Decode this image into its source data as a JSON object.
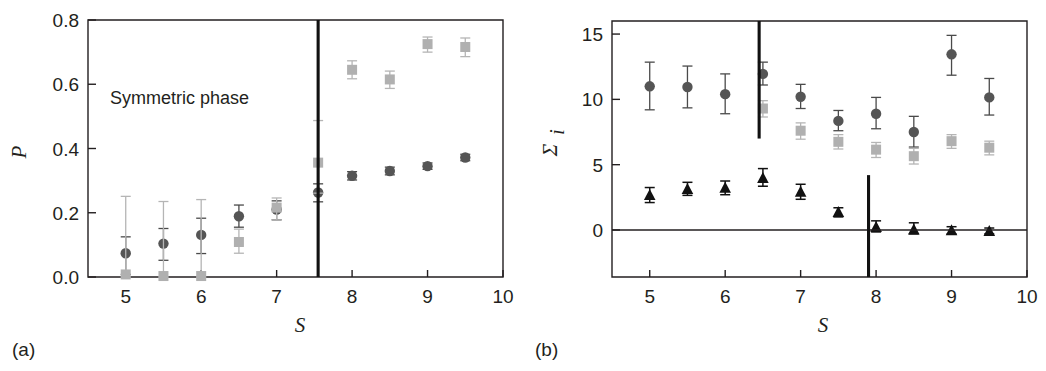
{
  "figure": {
    "background": "#ffffff",
    "marker_colors": {
      "circle": "#555555",
      "square": "#b0b0b0",
      "triangle": "#111111"
    }
  },
  "panels": [
    {
      "key": "a",
      "label": "(a)",
      "xlabel": "S",
      "ylabel": "P",
      "annotation": "Symmetric phase",
      "xticks": [
        "5",
        "6",
        "7",
        "8",
        "9",
        "10"
      ],
      "yticks": [
        "0.0",
        "0.2",
        "0.4",
        "0.6",
        "0.8"
      ]
    },
    {
      "key": "b",
      "label": "(b)",
      "xlabel": "S",
      "ylabel": "Σ",
      "ylabel_sub": "i",
      "xticks": [
        "5",
        "6",
        "7",
        "8",
        "9",
        "10"
      ],
      "yticks": [
        "0",
        "5",
        "10",
        "15"
      ]
    }
  ],
  "chart_data": [
    {
      "type": "scatter",
      "panel": "a",
      "title": "",
      "xlabel": "S",
      "ylabel": "P",
      "xlim": [
        4.5,
        10.0
      ],
      "ylim": [
        0.0,
        0.8
      ],
      "xticks": [
        5,
        6,
        7,
        8,
        9,
        10
      ],
      "yticks": [
        0.0,
        0.2,
        0.4,
        0.6,
        0.8
      ],
      "grid": false,
      "legend": "none",
      "annotations": [
        {
          "text": "Symmetric phase",
          "x": 6.1,
          "y": 0.53
        }
      ],
      "vlines": [
        {
          "x": 7.55,
          "y_from": 0.0,
          "y_to": 0.8,
          "color": "#111111"
        }
      ],
      "series": [
        {
          "name": "dark-circles",
          "marker": "circle",
          "color": "#555555",
          "x": [
            5.0,
            5.5,
            6.0,
            6.5,
            7.0,
            7.55,
            8.0,
            8.5,
            9.0,
            9.5
          ],
          "y": [
            0.074,
            0.104,
            0.131,
            0.189,
            0.21,
            0.263,
            0.315,
            0.33,
            0.345,
            0.372
          ],
          "yerr_low": [
            0.066,
            0.052,
            0.058,
            0.034,
            0.032,
            0.029,
            0.013,
            0.012,
            0.01,
            0.01
          ],
          "yerr_high": [
            0.051,
            0.047,
            0.052,
            0.035,
            0.027,
            0.027,
            0.013,
            0.012,
            0.01,
            0.01
          ]
        },
        {
          "name": "gray-squares",
          "marker": "square",
          "color": "#b0b0b0",
          "x": [
            5.0,
            5.5,
            6.0,
            6.5,
            7.0,
            7.55,
            8.0,
            8.5,
            9.0,
            9.5
          ],
          "y": [
            0.008,
            0.003,
            0.003,
            0.109,
            0.216,
            0.356,
            0.645,
            0.615,
            0.725,
            0.716
          ],
          "yerr_low": [
            0.008,
            0.003,
            0.003,
            0.035,
            0.038,
            0.095,
            0.028,
            0.028,
            0.025,
            0.03
          ],
          "yerr_high": [
            0.243,
            0.232,
            0.238,
            0.04,
            0.03,
            0.131,
            0.028,
            0.026,
            0.022,
            0.028
          ]
        }
      ]
    },
    {
      "type": "scatter",
      "panel": "b",
      "title": "",
      "xlabel": "S",
      "ylabel": "Σ_i",
      "xlim": [
        4.5,
        10.0
      ],
      "ylim": [
        -3.6,
        16.0
      ],
      "xticks": [
        5,
        6,
        7,
        8,
        9,
        10
      ],
      "yticks": [
        0,
        5,
        10,
        15
      ],
      "grid": false,
      "legend": "none",
      "annotations": [],
      "vlines": [
        {
          "x": 6.45,
          "y_from": 7.0,
          "y_to": 16.0,
          "color": "#111111"
        },
        {
          "x": 7.9,
          "y_from": -3.6,
          "y_to": 4.2,
          "color": "#111111"
        }
      ],
      "hlines": [
        {
          "y": 0,
          "color": "#231f20"
        }
      ],
      "series": [
        {
          "name": "dark-circles",
          "marker": "circle",
          "color": "#555555",
          "x": [
            5.0,
            5.5,
            6.0,
            6.5,
            7.0,
            7.5,
            8.0,
            8.5,
            9.0,
            9.5
          ],
          "y": [
            11.0,
            10.95,
            10.4,
            11.95,
            10.2,
            8.35,
            8.9,
            7.5,
            13.45,
            10.15
          ],
          "yerr_low": [
            1.8,
            1.6,
            1.5,
            0.85,
            0.9,
            0.75,
            1.15,
            1.15,
            1.6,
            1.35
          ],
          "yerr_high": [
            1.85,
            1.6,
            1.55,
            0.9,
            0.95,
            0.8,
            1.25,
            1.2,
            1.45,
            1.45
          ]
        },
        {
          "name": "gray-squares",
          "marker": "square",
          "color": "#b0b0b0",
          "x": [
            6.5,
            7.0,
            7.5,
            8.0,
            8.5,
            9.0,
            9.5
          ],
          "y": [
            9.3,
            7.6,
            6.75,
            6.15,
            5.65,
            6.8,
            6.3
          ],
          "yerr_low": [
            0.65,
            0.65,
            0.55,
            0.6,
            0.6,
            0.55,
            0.55
          ],
          "yerr_high": [
            0.6,
            0.6,
            0.55,
            0.55,
            0.6,
            0.5,
            0.5
          ]
        },
        {
          "name": "black-triangles",
          "marker": "triangle",
          "color": "#111111",
          "x": [
            5.0,
            5.5,
            6.0,
            6.5,
            7.0,
            7.5,
            8.0,
            8.5,
            9.0,
            9.5
          ],
          "y": [
            2.65,
            3.1,
            3.2,
            3.95,
            2.9,
            1.35,
            0.2,
            0.0,
            -0.05,
            -0.1
          ],
          "yerr_low": [
            0.55,
            0.45,
            0.5,
            0.6,
            0.55,
            0.35,
            0.35,
            0.3,
            0.25,
            0.2
          ],
          "yerr_high": [
            0.6,
            0.55,
            0.55,
            0.75,
            0.6,
            0.35,
            0.5,
            0.55,
            0.3,
            0.25
          ]
        }
      ]
    }
  ]
}
